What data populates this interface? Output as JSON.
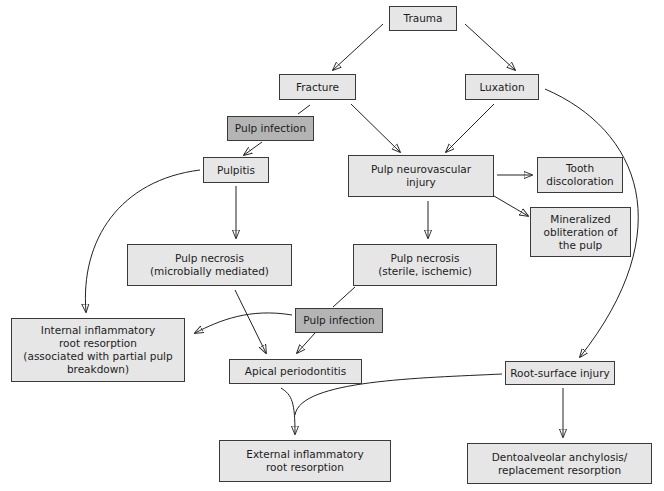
{
  "diagram": {
    "nodes": {
      "trauma": "Trauma",
      "fracture": "Fracture",
      "luxation": "Luxation",
      "pulp_infection_1": "Pulp infection",
      "pulpitis": "Pulpitis",
      "pulp_neurovascular_injury": "Pulp neurovascular\ninjury",
      "tooth_discoloration": "Tooth\ndiscoloration",
      "mineralized_obliteration": "Mineralized\nobliteration of\nthe pulp",
      "pulp_necrosis_microbial": "Pulp necrosis\n(microbially mediated)",
      "pulp_necrosis_sterile": "Pulp necrosis\n(sterile, ischemic)",
      "pulp_infection_2": "Pulp infection",
      "internal_inflammatory_resorption": "Internal inflammatory\nroot resorption\n(associated with partial pulp\nbreakdown)",
      "apical_periodontitis": "Apical periodontitis",
      "root_surface_injury": "Root-surface injury",
      "external_inflammatory_resorption": "External inflammatory\nroot resorption",
      "dentoalveolar_ankylosis": "Dentoalveolar anchylosis/\nreplacement resorption"
    },
    "edges": [
      [
        "trauma",
        "fracture"
      ],
      [
        "trauma",
        "luxation"
      ],
      [
        "fracture",
        "pulp_infection_1"
      ],
      [
        "fracture",
        "pulp_neurovascular_injury"
      ],
      [
        "luxation",
        "pulp_neurovascular_injury"
      ],
      [
        "luxation",
        "root_surface_injury"
      ],
      [
        "pulp_infection_1",
        "pulpitis"
      ],
      [
        "pulpitis",
        "pulp_necrosis_microbial"
      ],
      [
        "pulpitis",
        "internal_inflammatory_resorption"
      ],
      [
        "pulp_neurovascular_injury",
        "tooth_discoloration"
      ],
      [
        "pulp_neurovascular_injury",
        "mineralized_obliteration"
      ],
      [
        "pulp_neurovascular_injury",
        "pulp_necrosis_sterile"
      ],
      [
        "pulp_necrosis_sterile",
        "pulp_infection_2"
      ],
      [
        "pulp_infection_2",
        "internal_inflammatory_resorption"
      ],
      [
        "pulp_infection_2",
        "apical_periodontitis"
      ],
      [
        "pulp_necrosis_microbial",
        "apical_periodontitis"
      ],
      [
        "apical_periodontitis",
        "external_inflammatory_resorption"
      ],
      [
        "root_surface_injury",
        "external_inflammatory_resorption"
      ],
      [
        "root_surface_injury",
        "dentoalveolar_ankylosis"
      ]
    ],
    "colors": {
      "node_fill": "#e6e6e6",
      "highlight_fill": "#b4b4b4",
      "stroke": "#3a3a3a"
    }
  }
}
